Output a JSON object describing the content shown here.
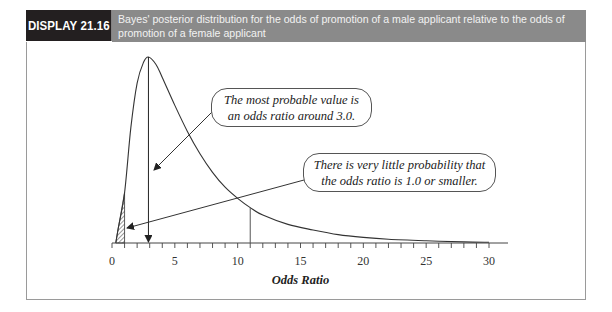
{
  "header": {
    "tag": "DISPLAY 21.16",
    "caption": "Bayes' posterior distribution for the odds of promotion of a male applicant relative to the odds of promotion of a female applicant"
  },
  "callouts": [
    {
      "line1": "The most probable value is",
      "line2": "an odds ratio around 3.0."
    },
    {
      "line1": "There is very little probability that",
      "line2": "the odds ratio is 1.0 or smaller."
    }
  ],
  "chart_data": {
    "type": "line",
    "title": "Bayes' posterior distribution for the odds of promotion of a male applicant relative to the odds of promotion of a female applicant",
    "xlabel": "Odds Ratio",
    "ylabel": "",
    "xlim": [
      0,
      30
    ],
    "xticks_major": [
      0,
      5,
      10,
      15,
      20,
      25,
      30
    ],
    "xtick_minor_step": 1,
    "grid": false,
    "series": [
      {
        "name": "posterior density",
        "x": [
          0.3,
          0.5,
          1.0,
          1.5,
          2.0,
          2.5,
          2.9,
          3.5,
          4.0,
          5.0,
          6.0,
          7.0,
          8.0,
          9.0,
          10.0,
          11.0,
          12.0,
          14.0,
          16.0,
          18.0,
          20.0,
          22.0,
          25.0,
          28.0,
          30.0
        ],
        "y": [
          0.0,
          0.08,
          0.27,
          0.62,
          0.86,
          0.97,
          1.0,
          0.96,
          0.89,
          0.74,
          0.6,
          0.48,
          0.38,
          0.3,
          0.24,
          0.19,
          0.15,
          0.1,
          0.07,
          0.045,
          0.03,
          0.02,
          0.012,
          0.006,
          0.004
        ]
      }
    ],
    "annotations": [
      {
        "type": "vertical_arrow",
        "x": 2.9,
        "label": "mode"
      },
      {
        "type": "vertical_line",
        "x": 11
      },
      {
        "type": "shaded_region",
        "x_from": 0,
        "x_to": 1.0,
        "pattern": "hatched"
      }
    ],
    "legend": null
  }
}
